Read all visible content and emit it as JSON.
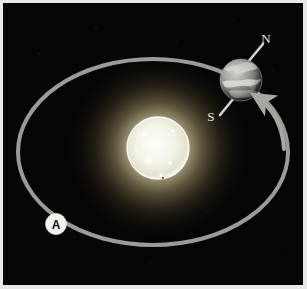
{
  "figure": {
    "domain": "diagram",
    "frame_color": "#e8e8e6",
    "background_color": "#050505"
  },
  "sun": {
    "name": "Sun",
    "center_x": 158,
    "center_y": 148,
    "radius": 30,
    "core_color": "#fdfdf8",
    "glow_color": "#fff6cf",
    "spots": [
      {
        "x": 144,
        "y": 134,
        "r": 2.2
      },
      {
        "x": 173,
        "y": 131,
        "r": 1.8
      },
      {
        "x": 148,
        "y": 160,
        "r": 3.0
      },
      {
        "x": 170,
        "y": 163,
        "r": 2.0
      },
      {
        "x": 157,
        "y": 145,
        "r": 1.4
      },
      {
        "x": 161,
        "y": 175,
        "r": 1.6
      },
      {
        "x": 136,
        "y": 150,
        "r": 1.2
      }
    ]
  },
  "orbit": {
    "name": "Earth orbital path",
    "shape": "ellipse",
    "center_x": 153,
    "center_y": 152,
    "radius_x": 137,
    "radius_y": 95,
    "stroke_color": "#9a9a96",
    "stroke_width": 4,
    "direction": "counter-clockwise",
    "arrow": {
      "label": "orbital-direction-arrow",
      "tip_x": 250,
      "tip_y": 92
    }
  },
  "earth": {
    "name": "Earth",
    "center_x": 243,
    "center_y": 79,
    "radius": 21,
    "axis_tilt_degrees": 23.5,
    "surface_color": "#8e8e8a",
    "axis": {
      "name": "rotational-axis",
      "stroke_color": "#cfcfc9"
    },
    "pole_labels": {
      "north": "N",
      "south": "S"
    }
  },
  "markers": [
    {
      "id": "A",
      "label": "A",
      "name": "orbit-position-marker-a",
      "x": 55,
      "y": 224,
      "radius": 10,
      "fill": "#f2f2ee",
      "text_color": "#111111"
    }
  ],
  "labels": {
    "north_pole": "N",
    "south_pole": "S",
    "position_a": "A"
  }
}
